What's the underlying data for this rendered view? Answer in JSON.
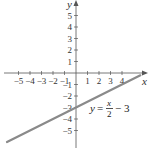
{
  "chart_data": {
    "type": "line",
    "title": "",
    "xlabel": "x",
    "ylabel": "y",
    "xlim": [
      -6.5,
      6
    ],
    "ylim": [
      -6.5,
      6.3
    ],
    "grid": false,
    "x_ticks": [
      -5,
      -4,
      -3,
      -2,
      -1,
      1,
      2,
      3,
      4
    ],
    "y_ticks": [
      5,
      4,
      3,
      2,
      1,
      -1,
      -2,
      -3,
      -4,
      -5
    ],
    "x_tick_labels": [
      "−5",
      "−4",
      "−3",
      "−2",
      "−1",
      "1",
      "2",
      "3",
      "4"
    ],
    "y_tick_labels": [
      "5",
      "4",
      "3",
      "2",
      "1",
      "−1",
      "−2",
      "−3",
      "−4",
      "−5"
    ],
    "series": [
      {
        "name": "y = x/2 − 3",
        "equation": "y = x/2 - 3",
        "slope": 0.5,
        "intercept": -3,
        "x": [
          -6,
          5.6
        ],
        "y": [
          -6,
          -0.2
        ],
        "color": "#8a8a8a"
      }
    ],
    "annotations": [
      {
        "text": "y = x/2 − 3",
        "x": 1.7,
        "y": -3
      }
    ]
  },
  "labels": {
    "x_axis": "x",
    "y_axis": "y",
    "eq_y": "y",
    "eq_equals": "=",
    "eq_num": "x",
    "eq_den": "2",
    "eq_rest": "− 3"
  }
}
